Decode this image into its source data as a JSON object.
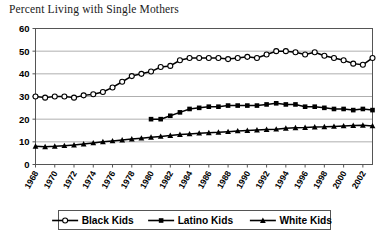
{
  "chart_data": {
    "type": "line",
    "title": "Percent Living with Single Mothers",
    "xlabel": "",
    "ylabel": "",
    "ylim": [
      0,
      60
    ],
    "ytick_step": 10,
    "yticks": [
      "0",
      "10",
      "20",
      "30",
      "40",
      "50",
      "60"
    ],
    "grid": true,
    "legend_position": "bottom",
    "x": [
      1968,
      1969,
      1970,
      1971,
      1972,
      1973,
      1974,
      1975,
      1976,
      1977,
      1978,
      1979,
      1980,
      1981,
      1982,
      1983,
      1984,
      1985,
      1986,
      1987,
      1988,
      1989,
      1990,
      1991,
      1992,
      1993,
      1994,
      1995,
      1996,
      1997,
      1998,
      1999,
      2000,
      2001,
      2002,
      2003
    ],
    "xtick_labels": [
      "1968",
      "1970",
      "1972",
      "1974",
      "1976",
      "1978",
      "1980",
      "1982",
      "1984",
      "1986",
      "1988",
      "1990",
      "1992",
      "1994",
      "1996",
      "1998",
      "2000",
      "2002"
    ],
    "series": [
      {
        "name": "Black Kids",
        "marker": "open-circle",
        "values": [
          30,
          29.5,
          30,
          30,
          29.5,
          30.5,
          31,
          32,
          34,
          36.5,
          39,
          40,
          41,
          43,
          43.5,
          46,
          47,
          47,
          47,
          47,
          46.5,
          47,
          47.5,
          47,
          48.5,
          50,
          50,
          49.5,
          48.5,
          49.5,
          48,
          47,
          46,
          44.5,
          44,
          47
        ]
      },
      {
        "name": "Latino Kids",
        "marker": "filled-square",
        "values": [
          null,
          null,
          null,
          null,
          null,
          null,
          null,
          null,
          null,
          null,
          null,
          null,
          20,
          20,
          21.5,
          23,
          24.5,
          25,
          25.5,
          25.5,
          26,
          26,
          26,
          26,
          26.5,
          27,
          26.5,
          26.5,
          25.5,
          25.5,
          25,
          24.5,
          24.5,
          24,
          24.5,
          24
        ]
      },
      {
        "name": "White Kids",
        "marker": "filled-triangle",
        "values": [
          8,
          7.8,
          8,
          8.3,
          8.6,
          9,
          9.5,
          10,
          10.4,
          10.8,
          11.2,
          11.6,
          12,
          12.4,
          12.8,
          13.2,
          13.5,
          13.8,
          14,
          14.2,
          14.5,
          14.8,
          15,
          15.2,
          15.4,
          15.6,
          16,
          16.2,
          16.3,
          16.5,
          16.6,
          16.8,
          17,
          17.2,
          17.3,
          17
        ]
      }
    ]
  }
}
